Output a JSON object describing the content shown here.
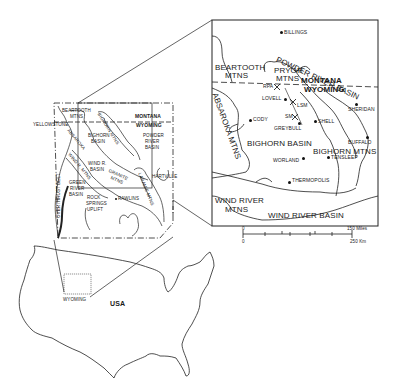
{
  "inset_map": {
    "labels": {
      "billings": "BILLINGS",
      "powder_river_basin": "POWDER RIVER BASIN",
      "beartooth_1": "BEARTOOTH",
      "beartooth_2": "MTNS",
      "pryor_1": "PRYOR",
      "pryor_2": "MTNS",
      "montana": "MONTANA",
      "wyoming": "WYOMING",
      "rpa": "RPA",
      "lovell": "LOVELL",
      "lsm": "LSM",
      "sm": "SM",
      "greybull": "GREYBULL",
      "shell": "SHELL",
      "cody": "CODY",
      "sheridan": "SHERIDAN",
      "absaroka": "ABSAROKA MTNS",
      "bighorn_basin": "BIGHORN BASIN",
      "bighorn_mtns": "BIGHORN MTNS",
      "buffalo": "BUFFALO",
      "worland": "WORLAND",
      "tensleep": "TENSLEEP",
      "thermopolis": "THERMOPOLIS",
      "wind_river_mtns_1": "WIND RIVER",
      "wind_river_mtns_2": "MTNS",
      "wind_river_basin": "WIND RIVER BASIN"
    },
    "scale": {
      "zero_top": "0",
      "miles": "150 Miles",
      "zero_bottom": "0",
      "km": "250 Km"
    }
  },
  "wyoming_map": {
    "labels": {
      "beartooth_1": "BEARTOOTH",
      "beartooth_2": "MTNS",
      "yellowstone": "YELLOWSTONE",
      "bighorn_mtns": "BIGHORN MTNS",
      "absaroka": "ABSAROKA",
      "bighorn_basin_1": "BIGHORN",
      "bighorn_basin_2": "BASIN",
      "montana": "MONTANA",
      "wyoming": "WYOMING",
      "powder_1": "POWDER",
      "powder_2": "RIVER",
      "powder_3": "BASIN",
      "wind_r_mtns": "WIND R. MTNS",
      "wind_r_basin_1": "WIND R.",
      "wind_r_basin_2": "BASIN",
      "granite_1": "GRANITE",
      "granite_2": "MTNS",
      "laramie": "LARAMIE MTNS",
      "hartville": "HARTVILLE",
      "overthrust": "OVERTHRUST BELT",
      "green_1": "GREEN",
      "green_2": "RIVER",
      "green_3": "BASIN",
      "rock_1": "ROCK",
      "rock_2": "SPRINGS",
      "rock_3": "UPLIFT",
      "rawlins": "RAWLINS"
    }
  },
  "usa_map": {
    "labels": {
      "wyoming": "WYOMING",
      "usa": "USA"
    }
  }
}
